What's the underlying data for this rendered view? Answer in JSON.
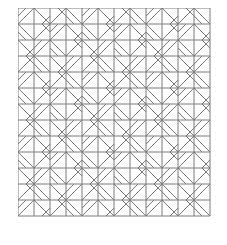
{
  "pattern": {
    "cols": 12,
    "rows": 13,
    "cell": 16,
    "stroke": "#7a7a7a",
    "background": "#ffffff",
    "tiles": [
      "ABDCABDCABDC",
      "CDABCDABCDAB",
      "BACDBACDBACD",
      "DCBADCBADCBA",
      "ABDCABDCABDC",
      "CDABCDABCDAB",
      "BACDBACDBACD",
      "DCBADCBADCBA",
      "ABDCABDCABDC",
      "CDABCDABCDAB",
      "BACDBACDBACD",
      "DCBADCBADCBA",
      "ABDCABDCABDC"
    ]
  }
}
